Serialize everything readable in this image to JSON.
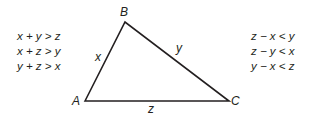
{
  "diagram": {
    "type": "triangle",
    "vertices": {
      "A": {
        "label": "A",
        "x": 85,
        "y": 101
      },
      "B": {
        "label": "B",
        "x": 125,
        "y": 22
      },
      "C": {
        "label": "C",
        "x": 229,
        "y": 101
      }
    },
    "sides": {
      "AB": {
        "label": "x"
      },
      "BC": {
        "label": "y"
      },
      "AC": {
        "label": "z"
      }
    },
    "left_inequalities": [
      "x + y > z",
      "x + z > y",
      "y + z > x"
    ],
    "right_inequalities": [
      "z − x < y",
      "z − y < x",
      "y − x < z"
    ],
    "stroke_color": "#231f20"
  }
}
